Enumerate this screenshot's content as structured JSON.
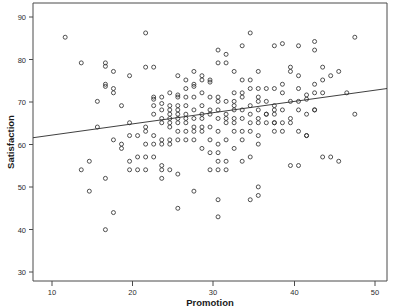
{
  "chart_data": {
    "type": "scatter",
    "title": "",
    "subtitle": "",
    "xlabel": "Promotion",
    "ylabel": "Satisfaction",
    "xlim": [
      8,
      52
    ],
    "ylim": [
      27,
      92
    ],
    "xticks": [
      10,
      20,
      30,
      40,
      50
    ],
    "yticks": [
      30,
      40,
      50,
      60,
      70,
      80,
      90
    ],
    "xtick_labels": [
      "10",
      "20",
      "30",
      "40",
      "50"
    ],
    "ytick_labels": [
      "30",
      "40",
      "50",
      "60",
      "70",
      "80",
      "90"
    ],
    "grid": false,
    "legend": "none",
    "marker": "open-circle",
    "marker_size": 4,
    "series": [
      {
        "name": "Observations",
        "points": [
          [
            12,
            84
          ],
          [
            22,
            85
          ],
          [
            48,
            84
          ],
          [
            35,
            85
          ],
          [
            14,
            78
          ],
          [
            41,
            82
          ],
          [
            43,
            83
          ],
          [
            38,
            82
          ],
          [
            39,
            82.5
          ],
          [
            34,
            82
          ],
          [
            31,
            81
          ],
          [
            43,
            81
          ],
          [
            32,
            80
          ],
          [
            17,
            78
          ],
          [
            18,
            76
          ],
          [
            31,
            78
          ],
          [
            32,
            78
          ],
          [
            20,
            75
          ],
          [
            23,
            77
          ],
          [
            44,
            77
          ],
          [
            17,
            77.2
          ],
          [
            26,
            75
          ],
          [
            28,
            76
          ],
          [
            36,
            76
          ],
          [
            40,
            76
          ],
          [
            41,
            75
          ],
          [
            46,
            76
          ],
          [
            29,
            75
          ],
          [
            30,
            74
          ],
          [
            33,
            76
          ],
          [
            40,
            77
          ],
          [
            45,
            75
          ],
          [
            17,
            73
          ],
          [
            18,
            72
          ],
          [
            29,
            74
          ],
          [
            30,
            73.5
          ],
          [
            34,
            74
          ],
          [
            35,
            74
          ],
          [
            39,
            73
          ],
          [
            27,
            74
          ],
          [
            28,
            73
          ],
          [
            36,
            72
          ],
          [
            43,
            73
          ],
          [
            44,
            74
          ],
          [
            18,
            71
          ],
          [
            16,
            69
          ],
          [
            17,
            72.5
          ],
          [
            19,
            68
          ],
          [
            27,
            72
          ],
          [
            28,
            72.5
          ],
          [
            29,
            71
          ],
          [
            33,
            71
          ],
          [
            34,
            71
          ],
          [
            35,
            72
          ],
          [
            37,
            72
          ],
          [
            38,
            72
          ],
          [
            41,
            72
          ],
          [
            23,
            70
          ],
          [
            23,
            69.5
          ],
          [
            24,
            70
          ],
          [
            25,
            71
          ],
          [
            26,
            70.5
          ],
          [
            26,
            70
          ],
          [
            27,
            70
          ],
          [
            28,
            70
          ],
          [
            30,
            70
          ],
          [
            31,
            70
          ],
          [
            33,
            69
          ],
          [
            34,
            70
          ],
          [
            36,
            70
          ],
          [
            39,
            71
          ],
          [
            42,
            70.5
          ],
          [
            43,
            71
          ],
          [
            47,
            71
          ],
          [
            44,
            71
          ],
          [
            23,
            68
          ],
          [
            24,
            68.5
          ],
          [
            25,
            68
          ],
          [
            26,
            68
          ],
          [
            27,
            68
          ],
          [
            29,
            68
          ],
          [
            31,
            69
          ],
          [
            32,
            69
          ],
          [
            33,
            68
          ],
          [
            35,
            68
          ],
          [
            37,
            69
          ],
          [
            40,
            69
          ],
          [
            41,
            69
          ],
          [
            42,
            69.5
          ],
          [
            38,
            68
          ],
          [
            36,
            69
          ],
          [
            22,
            77
          ],
          [
            24,
            67
          ],
          [
            25,
            67
          ],
          [
            26,
            67
          ],
          [
            28,
            67
          ],
          [
            30,
            67
          ],
          [
            31,
            67
          ],
          [
            33,
            67
          ],
          [
            34,
            67
          ],
          [
            36,
            67
          ],
          [
            38,
            67
          ],
          [
            39,
            67
          ],
          [
            41,
            67
          ],
          [
            43,
            67
          ],
          [
            29,
            66
          ],
          [
            23,
            66
          ],
          [
            25,
            66
          ],
          [
            26,
            66
          ],
          [
            27,
            66
          ],
          [
            30,
            66
          ],
          [
            32,
            66
          ],
          [
            35,
            66
          ],
          [
            37,
            66
          ],
          [
            38,
            66
          ],
          [
            40,
            65
          ],
          [
            42,
            66
          ],
          [
            16,
            63
          ],
          [
            20,
            64
          ],
          [
            22,
            63
          ],
          [
            24,
            65
          ],
          [
            25,
            65
          ],
          [
            26,
            65
          ],
          [
            27,
            65
          ],
          [
            28,
            65
          ],
          [
            29,
            65
          ],
          [
            31,
            65
          ],
          [
            32,
            65
          ],
          [
            33,
            65
          ],
          [
            34,
            65
          ],
          [
            36,
            65
          ],
          [
            38,
            64
          ],
          [
            39,
            64
          ],
          [
            40,
            64
          ],
          [
            21,
            61
          ],
          [
            22,
            62
          ],
          [
            24,
            64
          ],
          [
            25,
            64
          ],
          [
            26,
            64
          ],
          [
            27,
            64
          ],
          [
            28,
            63
          ],
          [
            29,
            63
          ],
          [
            30,
            63
          ],
          [
            32,
            64
          ],
          [
            33,
            64
          ],
          [
            35,
            64
          ],
          [
            36,
            64
          ],
          [
            37,
            64
          ],
          [
            41,
            62
          ],
          [
            42,
            61
          ],
          [
            18,
            60
          ],
          [
            20,
            61
          ],
          [
            23,
            61
          ],
          [
            25,
            63
          ],
          [
            26,
            62
          ],
          [
            27,
            62
          ],
          [
            28,
            62
          ],
          [
            29,
            62
          ],
          [
            31,
            62
          ],
          [
            33,
            62
          ],
          [
            34,
            62
          ],
          [
            35,
            62
          ],
          [
            38,
            62
          ],
          [
            36,
            61
          ],
          [
            19,
            58
          ],
          [
            19,
            59
          ],
          [
            22,
            59
          ],
          [
            23,
            59
          ],
          [
            24,
            60
          ],
          [
            25,
            60
          ],
          [
            26,
            60
          ],
          [
            27,
            60
          ],
          [
            28,
            60
          ],
          [
            30,
            60
          ],
          [
            32,
            60
          ],
          [
            34,
            60
          ],
          [
            36,
            59
          ],
          [
            31,
            59
          ],
          [
            20,
            55
          ],
          [
            21,
            56
          ],
          [
            22,
            56
          ],
          [
            23,
            56
          ],
          [
            24,
            59
          ],
          [
            25,
            59
          ],
          [
            29,
            58
          ],
          [
            30,
            57
          ],
          [
            31,
            57
          ],
          [
            33,
            58
          ],
          [
            35,
            56
          ],
          [
            14,
            53
          ],
          [
            15,
            55
          ],
          [
            20,
            53
          ],
          [
            21,
            53
          ],
          [
            22,
            53
          ],
          [
            24,
            53
          ],
          [
            25,
            53
          ],
          [
            26,
            52
          ],
          [
            31,
            55
          ],
          [
            32,
            55
          ],
          [
            34,
            55
          ],
          [
            24,
            54
          ],
          [
            40,
            54
          ],
          [
            41,
            54
          ],
          [
            44,
            56
          ],
          [
            46,
            55
          ],
          [
            48,
            66
          ],
          [
            17,
            51
          ],
          [
            24,
            51
          ],
          [
            30,
            53
          ],
          [
            31,
            53
          ],
          [
            32,
            53
          ],
          [
            39,
            62
          ],
          [
            15,
            48
          ],
          [
            28,
            48
          ],
          [
            36,
            49
          ],
          [
            36,
            47
          ],
          [
            35,
            46
          ],
          [
            31,
            46
          ],
          [
            26,
            44
          ],
          [
            18,
            43
          ],
          [
            31,
            42
          ],
          [
            17,
            39
          ],
          [
            42,
            61
          ],
          [
            43,
            67
          ],
          [
            45,
            56
          ],
          [
            37,
            66
          ],
          [
            38,
            64
          ]
        ]
      }
    ],
    "fit_line": {
      "name": "Linear fit",
      "x_start": 8,
      "y_start": 60.5,
      "x_end": 52,
      "y_end": 72.0
    }
  },
  "axes": {
    "y_label": "Satisfaction",
    "x_label": "Promotion"
  }
}
